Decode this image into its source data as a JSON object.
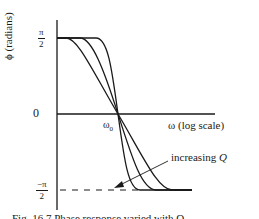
{
  "figure": {
    "type": "phase-response-diagram",
    "y_axis": {
      "label": "ϕ (radians)",
      "ticks": [
        {
          "label_num": "π",
          "label_den": "2",
          "sign": "",
          "value": "π/2"
        },
        {
          "label": "0",
          "value": "0"
        },
        {
          "label_num": "π",
          "label_den": "2",
          "sign": "−",
          "value": "−π/2"
        }
      ]
    },
    "x_axis": {
      "label": "ω  (log scale)",
      "marker": {
        "symbol": "ω",
        "subscript": "0"
      }
    },
    "annotation": {
      "text": "increasing ",
      "variable": "Q"
    },
    "curves": [
      {
        "name": "low-Q",
        "description": "gentlest slope"
      },
      {
        "name": "medium-Q",
        "description": "intermediate slope"
      },
      {
        "name": "high-Q",
        "description": "steepest slope"
      }
    ],
    "caption": "Fig. 16.7  Phase response varied with Q"
  },
  "colors": {
    "ink": "#1a1a1a",
    "background": "#ffffff"
  }
}
